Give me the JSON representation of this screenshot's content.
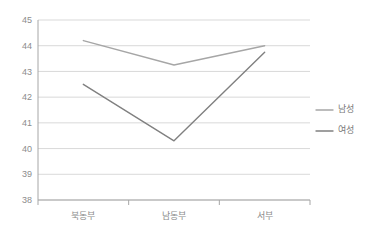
{
  "chart_data": {
    "type": "line",
    "title": "",
    "xlabel": "",
    "ylabel": "",
    "categories": [
      "북동부",
      "남동부",
      "서부"
    ],
    "series": [
      {
        "name": "남성",
        "values": [
          44.2,
          43.25,
          44.0
        ],
        "color": "#a6a6a6"
      },
      {
        "name": "여성",
        "values": [
          42.5,
          40.3,
          43.75
        ],
        "color": "#808080"
      }
    ],
    "ylim": [
      38,
      45
    ],
    "yticks": [
      38,
      39,
      40,
      41,
      42,
      43,
      44,
      45
    ],
    "ytick_labels": [
      "38",
      "39",
      "40",
      "41",
      "42",
      "43",
      "44",
      "45"
    ],
    "grid": true,
    "grid_axis": "y",
    "legend_position": "right",
    "colors": {
      "grid": "#d9d9d9",
      "axis": "#a6a6a6",
      "tick_label": "#8c8c8c",
      "legend_label": "#7a7a7a",
      "background": "#ffffff"
    }
  },
  "legend": {
    "items": [
      {
        "label": "남성",
        "color": "#a6a6a6"
      },
      {
        "label": "여성",
        "color": "#808080"
      }
    ]
  },
  "axes": {
    "y_tick_labels": [
      "45",
      "44",
      "43",
      "42",
      "41",
      "40",
      "39",
      "38"
    ],
    "x_tick_labels": [
      "북동부",
      "남동부",
      "서부"
    ]
  }
}
